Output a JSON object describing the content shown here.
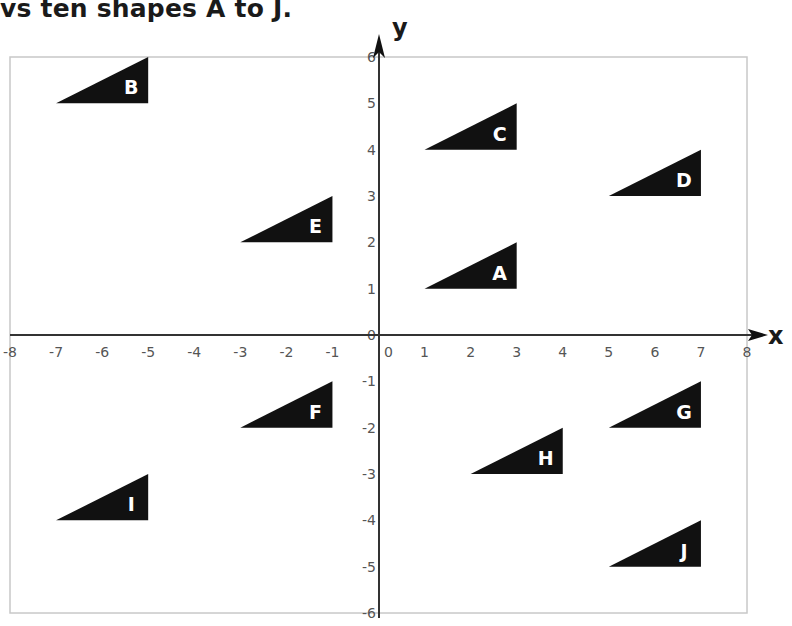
{
  "header": {
    "text": "vs ten shapes A to J."
  },
  "axes": {
    "x_label": "x",
    "y_label": "y",
    "x_range": [
      -8,
      8
    ],
    "y_range": [
      -6,
      6
    ],
    "x_ticks": [
      "-8",
      "-7",
      "-6",
      "-5",
      "-4",
      "-3",
      "-2",
      "-1",
      "0",
      "1",
      "2",
      "3",
      "4",
      "5",
      "6",
      "7",
      "8"
    ],
    "y_ticks": [
      "-6",
      "-5",
      "-4",
      "-3",
      "-2",
      "-1",
      "0",
      "1",
      "2",
      "3",
      "4",
      "5",
      "6"
    ],
    "origin_label": "0"
  },
  "colors": {
    "shape_fill": "#111111",
    "frame": "#c8c8c8",
    "axis": "#333333",
    "tick_text": "#555555"
  },
  "chart_data": {
    "type": "scatter",
    "title": "ten shapes A to J",
    "xlabel": "x",
    "ylabel": "y",
    "xlim": [
      -8,
      8
    ],
    "ylim": [
      -6,
      6
    ],
    "grid": false,
    "shapes": [
      {
        "label": "A",
        "vertices": [
          [
            1,
            1
          ],
          [
            3,
            1
          ],
          [
            3,
            2
          ]
        ]
      },
      {
        "label": "B",
        "vertices": [
          [
            -7,
            5
          ],
          [
            -5,
            5
          ],
          [
            -5,
            6
          ]
        ]
      },
      {
        "label": "C",
        "vertices": [
          [
            1,
            4
          ],
          [
            3,
            4
          ],
          [
            3,
            5
          ]
        ]
      },
      {
        "label": "D",
        "vertices": [
          [
            5,
            3
          ],
          [
            7,
            3
          ],
          [
            7,
            4
          ]
        ]
      },
      {
        "label": "E",
        "vertices": [
          [
            -3,
            2
          ],
          [
            -1,
            2
          ],
          [
            -1,
            3
          ]
        ]
      },
      {
        "label": "F",
        "vertices": [
          [
            -3,
            -2
          ],
          [
            -1,
            -2
          ],
          [
            -1,
            -1
          ]
        ]
      },
      {
        "label": "G",
        "vertices": [
          [
            5,
            -2
          ],
          [
            7,
            -2
          ],
          [
            7,
            -1
          ]
        ]
      },
      {
        "label": "H",
        "vertices": [
          [
            2,
            -3
          ],
          [
            4,
            -3
          ],
          [
            4,
            -2
          ]
        ]
      },
      {
        "label": "I",
        "vertices": [
          [
            -7,
            -4
          ],
          [
            -5,
            -4
          ],
          [
            -5,
            -3
          ]
        ]
      },
      {
        "label": "J",
        "vertices": [
          [
            5,
            -5
          ],
          [
            7,
            -5
          ],
          [
            7,
            -4
          ]
        ]
      }
    ]
  }
}
